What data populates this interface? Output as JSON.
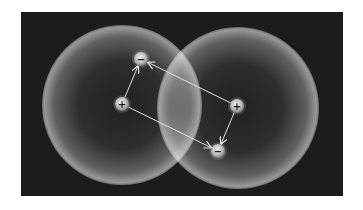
{
  "diagram": {
    "title": "",
    "panel": {
      "background": "#1c1c1c"
    },
    "atoms": [
      {
        "name": "atom-left",
        "cx": 122,
        "cy": 105,
        "r": 80
      },
      {
        "name": "atom-right",
        "cx": 238,
        "cy": 108,
        "r": 81
      }
    ],
    "charges": [
      {
        "name": "proton-left",
        "symbol": "+",
        "x": 122,
        "y": 104
      },
      {
        "name": "electron-left",
        "symbol": "−",
        "x": 141,
        "y": 59
      },
      {
        "name": "proton-right",
        "symbol": "+",
        "x": 237,
        "y": 106
      },
      {
        "name": "electron-right",
        "symbol": "−",
        "x": 218,
        "y": 151
      }
    ],
    "arrows": [
      {
        "from": "proton-left",
        "to": "electron-left",
        "kind": "attraction"
      },
      {
        "from": "proton-left",
        "to": "electron-right",
        "kind": "attraction"
      },
      {
        "from": "proton-right",
        "to": "electron-left",
        "kind": "attraction"
      },
      {
        "from": "proton-right",
        "to": "electron-right",
        "kind": "attraction"
      }
    ]
  }
}
